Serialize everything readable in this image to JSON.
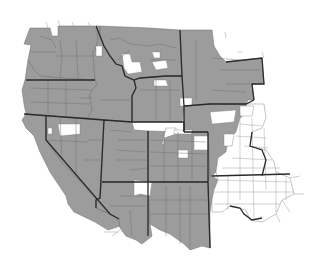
{
  "map": {
    "type": "choropleth",
    "region": "Western United States (county level)",
    "colors": {
      "shaded": "#9c9c9c",
      "unshaded": "#ffffff",
      "state_border": "#2a2a2a",
      "county_border": "#6e6e6e"
    },
    "legend": null,
    "labels": []
  }
}
